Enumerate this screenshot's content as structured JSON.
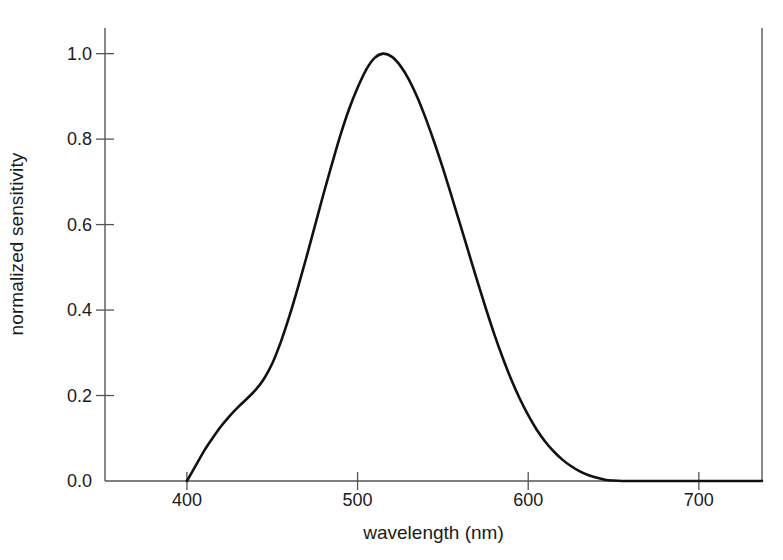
{
  "chart_data": {
    "type": "line",
    "title": "",
    "xlabel": "wavelength (nm)",
    "ylabel": "normalized sensitivity",
    "xlim": [
      352,
      737
    ],
    "ylim": [
      0.0,
      1.06
    ],
    "xticks": [
      400,
      500,
      600,
      700
    ],
    "xticklabels": [
      "400",
      "500",
      "600",
      "700"
    ],
    "yticks": [
      0.0,
      0.2,
      0.4,
      0.6,
      0.8,
      1.0
    ],
    "yticklabels": [
      "0.0",
      "0.2",
      "0.4",
      "0.6",
      "0.8",
      "1.0"
    ],
    "grid": false,
    "legend": null,
    "line_color": "#111111",
    "axis_color": "#555555",
    "series": [
      {
        "name": "normalized sensitivity",
        "x": [
          400,
          405,
          410,
          415,
          420,
          425,
          430,
          435,
          440,
          445,
          450,
          455,
          460,
          465,
          470,
          475,
          480,
          485,
          490,
          495,
          500,
          505,
          510,
          515,
          520,
          525,
          530,
          535,
          540,
          545,
          550,
          555,
          560,
          565,
          570,
          575,
          580,
          585,
          590,
          595,
          600,
          605,
          610,
          615,
          620,
          625,
          630,
          635,
          640,
          645,
          650,
          655,
          660,
          680,
          700,
          720,
          737
        ],
        "y": [
          0.0,
          0.035,
          0.07,
          0.1,
          0.128,
          0.152,
          0.173,
          0.192,
          0.212,
          0.238,
          0.275,
          0.325,
          0.385,
          0.452,
          0.523,
          0.597,
          0.671,
          0.742,
          0.81,
          0.87,
          0.92,
          0.962,
          0.99,
          1.0,
          0.993,
          0.972,
          0.94,
          0.898,
          0.848,
          0.792,
          0.732,
          0.668,
          0.602,
          0.536,
          0.47,
          0.406,
          0.345,
          0.289,
          0.238,
          0.193,
          0.154,
          0.12,
          0.092,
          0.069,
          0.05,
          0.035,
          0.023,
          0.014,
          0.008,
          0.003,
          0.001,
          0.0,
          0.0,
          0.0,
          0.0,
          0.0,
          0.0
        ]
      }
    ]
  },
  "axes": {
    "ylabel_text": "normalized sensitivity",
    "xlabel_text": "wavelength (nm)"
  }
}
